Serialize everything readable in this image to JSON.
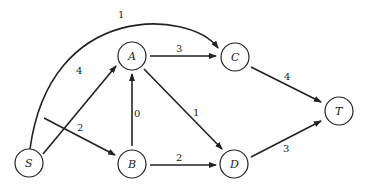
{
  "graph": {
    "nodes": [
      {
        "id": "S",
        "label": "S",
        "x": 29,
        "y": 163
      },
      {
        "id": "A",
        "label": "A",
        "x": 132,
        "y": 56
      },
      {
        "id": "C",
        "label": "C",
        "x": 235,
        "y": 57
      },
      {
        "id": "B",
        "label": "B",
        "x": 132,
        "y": 164
      },
      {
        "id": "D",
        "label": "D",
        "x": 234,
        "y": 164
      },
      {
        "id": "T",
        "label": "T",
        "x": 339,
        "y": 111
      }
    ],
    "edges": [
      {
        "from": "S",
        "to": "C",
        "weight": "1",
        "curved": true
      },
      {
        "from": "S",
        "to": "A",
        "weight": "4"
      },
      {
        "from": "S",
        "to": "B",
        "weight": "2"
      },
      {
        "from": "A",
        "to": "C",
        "weight": "3"
      },
      {
        "from": "A",
        "to": "D",
        "weight": "1"
      },
      {
        "from": "B",
        "to": "A",
        "weight": "0"
      },
      {
        "from": "B",
        "to": "D",
        "weight": "2"
      },
      {
        "from": "C",
        "to": "T",
        "weight": "4"
      },
      {
        "from": "D",
        "to": "T",
        "weight": "3"
      }
    ]
  }
}
